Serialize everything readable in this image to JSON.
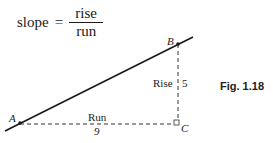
{
  "formula": {
    "lhs": "slope",
    "equals": "=",
    "numerator": "rise",
    "denominator": "run"
  },
  "points": {
    "A": "A",
    "B": "B",
    "C": "C"
  },
  "labels": {
    "rise": "Rise",
    "rise_value": "5",
    "run": "Run",
    "run_value": "9"
  },
  "figure_label": "Fig. 1.18"
}
